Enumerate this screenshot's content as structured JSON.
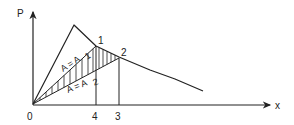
{
  "diagram": {
    "axis_y_label": "P",
    "axis_x_label": "x",
    "origin_label": "0",
    "point_labels": {
      "p1": "1",
      "p2": "2"
    },
    "tick_labels": {
      "t4": "4",
      "t3": "3"
    },
    "area_labels": {
      "a1": "A = A",
      "a1_sub": "1",
      "a2": "A = A",
      "a2_sub": "2"
    },
    "line_color": "#222222"
  }
}
